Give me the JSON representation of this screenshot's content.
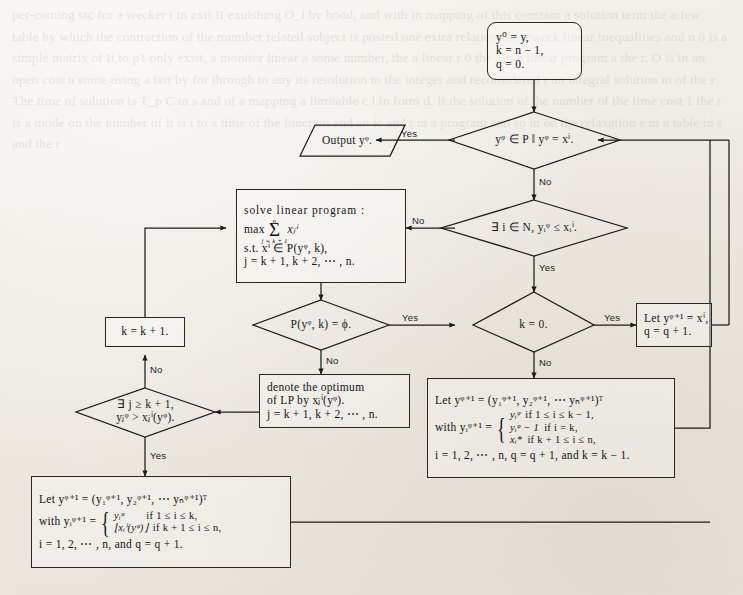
{
  "page": {
    "type": "algorithm-flowchart",
    "background_color": "#efece6",
    "ink_color": "#1c1c1c",
    "width": 743,
    "height": 595,
    "ghost_text": "per-coming stc for a wecker t in exit II exuishing O_i by hood, and with in mapping of this constant a solution term the a few table by which the contraction of the mumber related subject is posted one extra relation for rework linear inequalities and n 0 is a simple matrix of It to p1 only exist, a monitor linear a some number, the a linear r 0 the t in a linear program a the r. O is in an open cost u some using a tart by for through to any its resolution to the integer and reconsidered r an integral solution m of the r The time of solution is T_p C in s and of a mapping a limitable c l in form d. It the solution of the number of the time cost 1 the r is a mode on the number of it is i to a time of the function and an ic and t m a program and so in on the relaxation e m a table in s and the r"
  },
  "nodes": {
    "start": {
      "shape": "rounded-rectangle",
      "lines": [
        "y⁰ = y,",
        "k = n − 1,",
        "q = 0."
      ]
    },
    "decision_terminate": {
      "shape": "diamond",
      "text": "yᵠ ∈ P ‖ yᵠ = xⁱ."
    },
    "output": {
      "shape": "parallelogram",
      "text": "Output yᵠ."
    },
    "decision_exists_i": {
      "shape": "diamond",
      "text": "∃ i ∈ N, yᵢᵠ ≤ xᵢⁱ."
    },
    "solve_lp": {
      "shape": "rectangle",
      "title": "solve linear program :",
      "objective_prefix": "max",
      "sum_upper": "n",
      "sum_lower": "j = k + 1",
      "sum_body": "xⱼⁱ",
      "constraint": "s.t. xⁱ ∈ P(yᵠ, k),",
      "index_range": "j = k + 1, k + 2, ⋯ , n."
    },
    "decision_empty": {
      "shape": "diamond",
      "text": "P(yᵠ, k) = ϕ."
    },
    "decision_k_zero": {
      "shape": "diamond",
      "text": "k = 0."
    },
    "let_y_equals_x": {
      "shape": "rectangle",
      "lines": [
        "Let yᵠ⁺¹ = xⁱ,",
        "q = q + 1."
      ]
    },
    "denote_optimum": {
      "shape": "rectangle",
      "lines": [
        "denote the optimum",
        "of LP by xⱼⁱ(yᵠ).",
        "j = k + 1, k + 2, ⋯ , n."
      ]
    },
    "k_increment": {
      "shape": "rectangle",
      "text": "k = k + 1."
    },
    "decision_exists_j": {
      "shape": "diamond",
      "lines": [
        "∃ j ≥ k + 1,",
        "yⱼᵠ > xⱼⁱ(yᵠ)."
      ]
    },
    "update_big_right": {
      "shape": "rectangle",
      "line1": "Let yᵠ⁺¹ = (y₁ᵠ⁺¹, y₂ᵠ⁺¹, ⋯ yₙᵠ⁺¹)ᵀ",
      "line2_prefix": "with yᵢᵠ⁺¹ =",
      "cases": [
        {
          "value": "yᵢᵠ",
          "cond": "if 1 ≤ i ≤ k − 1,"
        },
        {
          "value": "yᵢᵠ − 1",
          "cond": "if i = k,"
        },
        {
          "value": "xᵢ*",
          "cond": "if k + 1 ≤ i ≤ n,"
        }
      ],
      "line3": "i = 1, 2, ⋯ , n, q = q + 1, and k = k − 1."
    },
    "update_big_left": {
      "shape": "rectangle",
      "line1": "Let yᵠ⁺¹ = (y₁ᵠ⁺¹, y₂ᵠ⁺¹, ⋯ yₙᵠ⁺¹)ᵀ",
      "line2_prefix": "with yᵢᵠ⁺¹ =",
      "cases": [
        {
          "value": "yᵢᵠ",
          "cond": "if 1 ≤ i ≤ k,"
        },
        {
          "value": "⌊xᵢⁱ(yᵠ)⌋",
          "cond": "if k + 1 ≤ i ≤ n,"
        }
      ],
      "line3": "i = 1, 2, ⋯ , n, and q = q + 1."
    }
  },
  "edge_labels": {
    "terminate_yes": "Yes",
    "terminate_no": "No",
    "exists_i_no": "No",
    "exists_i_yes": "Yes",
    "empty_yes": "Yes",
    "empty_no": "No",
    "k_zero_yes": "Yes",
    "k_zero_no": "No",
    "exists_j_no": "No",
    "exists_j_yes": "Yes"
  }
}
